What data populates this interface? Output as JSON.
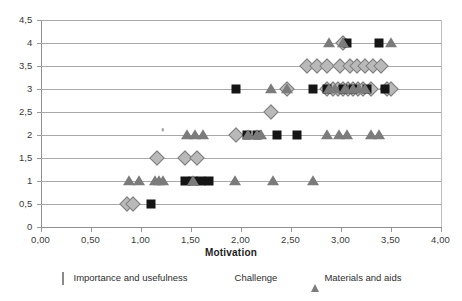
{
  "chart_data": {
    "type": "scatter",
    "title": "",
    "xlabel": "Motivation",
    "ylabel": "",
    "xlim": [
      0,
      4
    ],
    "ylim": [
      0,
      4.5
    ],
    "grid": true,
    "legend_position": "bottom",
    "xticks": [
      "0,00",
      "0,50",
      "1,00",
      "1,50",
      "2,00",
      "2,50",
      "3,00",
      "3,50",
      "4,00"
    ],
    "xtick_values": [
      0,
      0.5,
      1,
      1.5,
      2,
      2.5,
      3,
      3.5,
      4
    ],
    "yticks": [
      "0",
      "0,5",
      "1",
      "1,5",
      "2",
      "2,5",
      "3",
      "3,5",
      "4",
      "4,5"
    ],
    "ytick_values": [
      0,
      0.5,
      1,
      1.5,
      2,
      2.5,
      3,
      3.5,
      4,
      4.5
    ],
    "series": [
      {
        "name": "Importance and usefulness",
        "marker": "diamond",
        "color": "#b9b9b9",
        "points": [
          [
            0.86,
            0.5
          ],
          [
            0.92,
            0.5
          ],
          [
            1.16,
            1.5
          ],
          [
            1.44,
            1.5
          ],
          [
            1.56,
            1.5
          ],
          [
            1.95,
            2.0
          ],
          [
            2.3,
            2.5
          ],
          [
            2.46,
            3.0
          ],
          [
            2.86,
            3.0
          ],
          [
            2.92,
            3.0
          ],
          [
            2.97,
            3.0
          ],
          [
            3.02,
            3.0
          ],
          [
            3.07,
            3.0
          ],
          [
            3.12,
            3.0
          ],
          [
            3.17,
            3.0
          ],
          [
            3.22,
            3.0
          ],
          [
            3.3,
            3.0
          ],
          [
            3.46,
            3.0
          ],
          [
            3.5,
            3.0
          ],
          [
            2.66,
            3.5
          ],
          [
            2.76,
            3.5
          ],
          [
            2.86,
            3.5
          ],
          [
            2.99,
            3.5
          ],
          [
            3.09,
            3.5
          ],
          [
            3.16,
            3.5
          ],
          [
            3.24,
            3.5
          ],
          [
            3.32,
            3.5
          ],
          [
            3.4,
            3.5
          ],
          [
            3.02,
            4.0
          ]
        ]
      },
      {
        "name": "Challenge",
        "marker": "square",
        "color": "#151515",
        "points": [
          [
            1.1,
            0.5
          ],
          [
            1.44,
            1.0
          ],
          [
            1.52,
            1.0
          ],
          [
            1.6,
            1.0
          ],
          [
            1.68,
            1.0
          ],
          [
            2.06,
            2.0
          ],
          [
            2.16,
            2.0
          ],
          [
            2.36,
            2.0
          ],
          [
            2.56,
            2.0
          ],
          [
            1.95,
            3.0
          ],
          [
            2.72,
            3.0
          ],
          [
            2.86,
            3.0
          ],
          [
            3.02,
            3.0
          ],
          [
            3.12,
            3.0
          ],
          [
            3.26,
            3.0
          ],
          [
            3.44,
            3.0
          ],
          [
            3.06,
            4.0
          ],
          [
            3.38,
            4.0
          ]
        ]
      },
      {
        "name": "Materials and aids",
        "marker": "triangle",
        "color": "#7b7b7b",
        "points": [
          [
            0.88,
            1.0
          ],
          [
            0.98,
            1.0
          ],
          [
            1.14,
            1.0
          ],
          [
            1.18,
            1.0
          ],
          [
            1.22,
            1.0
          ],
          [
            1.52,
            1.0
          ],
          [
            1.94,
            1.0
          ],
          [
            2.32,
            1.0
          ],
          [
            2.72,
            1.0
          ],
          [
            1.46,
            2.0
          ],
          [
            1.54,
            2.0
          ],
          [
            1.62,
            2.0
          ],
          [
            2.07,
            2.0
          ],
          [
            2.16,
            2.0
          ],
          [
            2.2,
            2.0
          ],
          [
            2.86,
            2.0
          ],
          [
            2.98,
            2.0
          ],
          [
            3.06,
            2.0
          ],
          [
            3.3,
            2.0
          ],
          [
            3.38,
            2.0
          ],
          [
            2.3,
            3.0
          ],
          [
            2.46,
            3.0
          ],
          [
            2.88,
            3.0
          ],
          [
            2.94,
            3.0
          ],
          [
            3.04,
            3.0
          ],
          [
            3.12,
            3.0
          ],
          [
            3.18,
            3.0
          ],
          [
            3.24,
            3.0
          ],
          [
            2.88,
            4.0
          ],
          [
            3.02,
            4.0
          ],
          [
            3.5,
            4.0
          ]
        ]
      }
    ],
    "extra_marks": [
      {
        "x": 1.22,
        "y": 2.1,
        "note": "stray-small-mark"
      }
    ]
  },
  "legend": {
    "items": [
      {
        "label": "Importance and usefulness",
        "glyph": "diamond-icon"
      },
      {
        "label": "Challenge",
        "glyph": "square-icon"
      },
      {
        "label": "Materials and aids",
        "glyph": "triangle-icon"
      }
    ]
  },
  "colors": {
    "diamond": "#b9b9b9",
    "square": "#151515",
    "triangle": "#7b7b7b",
    "grid": "#a8a8a8",
    "axis": "#8f8f8f",
    "background": "#ffffff"
  }
}
